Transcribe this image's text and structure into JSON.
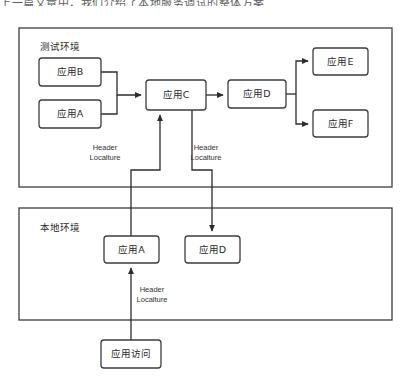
{
  "page": {
    "clipped_top_text": "上一篇文章中，我们介绍了本地服务调试的整体方案",
    "width": 407,
    "height": 386,
    "background": "#ffffff",
    "line_color": "#2c2c2c",
    "box_stroke": "#3d3d3d",
    "text_color": "#2a2a2a"
  },
  "containers": [
    {
      "id": "test-env",
      "label": "测试环境",
      "x": 19,
      "y": 28,
      "w": 373,
      "h": 159,
      "label_x": 40,
      "label_y": 47
    },
    {
      "id": "local-env",
      "label": "本地环境",
      "x": 19,
      "y": 208,
      "w": 373,
      "h": 112,
      "label_x": 40,
      "label_y": 228
    }
  ],
  "nodes": [
    {
      "id": "app-b",
      "label": "应用B",
      "x": 39,
      "y": 58,
      "w": 62,
      "h": 28
    },
    {
      "id": "app-a-test",
      "label": "应用A",
      "x": 39,
      "y": 100,
      "w": 62,
      "h": 28
    },
    {
      "id": "app-c",
      "label": "应用C",
      "x": 146,
      "y": 80,
      "w": 60,
      "h": 30
    },
    {
      "id": "app-d-test",
      "label": "应用D",
      "x": 228,
      "y": 80,
      "w": 58,
      "h": 28
    },
    {
      "id": "app-e",
      "label": "应用E",
      "x": 313,
      "y": 48,
      "w": 55,
      "h": 27
    },
    {
      "id": "app-f",
      "label": "应用F",
      "x": 313,
      "y": 110,
      "w": 55,
      "h": 27
    },
    {
      "id": "app-a-local",
      "label": "应用A",
      "x": 104,
      "y": 236,
      "w": 55,
      "h": 27
    },
    {
      "id": "app-d-local",
      "label": "应用D",
      "x": 185,
      "y": 236,
      "w": 55,
      "h": 27
    },
    {
      "id": "app-access",
      "label": "应用访问",
      "x": 101,
      "y": 340,
      "w": 60,
      "h": 28
    }
  ],
  "edge_labels": [
    {
      "id": "header-label-1",
      "line1": "Header",
      "line2": "Localture",
      "x": 105,
      "y": 148
    },
    {
      "id": "header-label-2",
      "line1": "Header",
      "line2": "Localture",
      "x": 206,
      "y": 148
    },
    {
      "id": "header-label-3",
      "line1": "Header",
      "line2": "Localture",
      "x": 152,
      "y": 290
    }
  ],
  "edges": [
    {
      "id": "edge-b-to-c",
      "from": "app-b",
      "to": "app-c",
      "d": "M101 72 L117 72 L117 95 L141 95",
      "arrow": true
    },
    {
      "id": "edge-a-to-c",
      "from": "app-a-test",
      "to": "app-c",
      "d": "M101 114 L117 114 L117 95",
      "arrow": false
    },
    {
      "id": "edge-c-to-d",
      "from": "app-c",
      "to": "app-d-test",
      "d": "M206 95 L223 95",
      "arrow": true
    },
    {
      "id": "edge-d-to-split",
      "from": "app-d-test",
      "to": "",
      "d": "M286 94 L296 94",
      "arrow": false
    },
    {
      "id": "edge-d-to-e",
      "from": "app-d-test",
      "to": "app-e",
      "d": "M296 94 L296 61 L308 61",
      "arrow": true
    },
    {
      "id": "edge-d-to-f",
      "from": "app-d-test",
      "to": "app-f",
      "d": "M296 94 L296 124 L308 124",
      "arrow": true
    },
    {
      "id": "edge-localA-to-c",
      "from": "app-a-local",
      "to": "app-c",
      "d": "M131 236 L131 170 L160 170 L160 115",
      "arrow": true
    },
    {
      "id": "edge-c-to-localD",
      "from": "app-c",
      "to": "app-d-local",
      "d": "M192 110 L192 170 L212 170 L212 231",
      "arrow": true
    },
    {
      "id": "edge-access-to-localA",
      "from": "app-access",
      "to": "app-a-local",
      "d": "M131 340 L131 268",
      "arrow": true
    }
  ]
}
